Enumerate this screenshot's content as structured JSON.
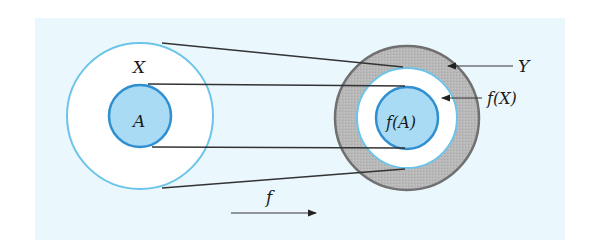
{
  "diagram": {
    "type": "function-image-illustration",
    "labels": {
      "domain_set": "X",
      "subset": "A",
      "image_of_subset": "f(A)",
      "image_of_domain": "f(X)",
      "codomain": "Y",
      "function": "f"
    },
    "colors": {
      "background": "#eaf7fc",
      "domain_fill": "#ffffff",
      "domain_stroke": "#6cc4ea",
      "subset_fill": "#a9dcf4",
      "subset_stroke": "#2f8fd0",
      "codomain_fill": "#b9b9b9",
      "codomain_stroke": "#707070",
      "line": "#333333"
    }
  }
}
